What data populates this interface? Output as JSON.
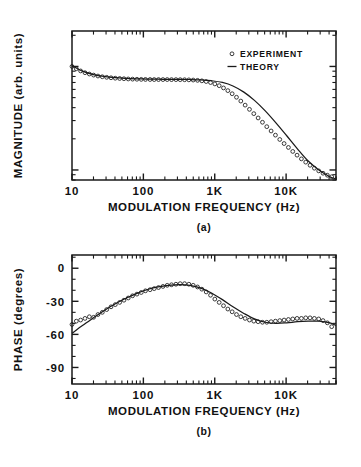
{
  "figure": {
    "caption_a": "(a)",
    "caption_b": "(b)"
  },
  "panel_a": {
    "ylabel": "MAGNITUDE (arb. units)",
    "xlabel": "MODULATION FREQUENCY (Hz)",
    "xticklabels": [
      "10",
      "100",
      "1K",
      "10K"
    ],
    "legend": [
      {
        "marker": "circle",
        "label": "EXPERIMENT"
      },
      {
        "marker": "line",
        "label": "THEORY"
      }
    ]
  },
  "panel_b": {
    "ylabel": "PHASE (degrees)",
    "xlabel": "MODULATION FREQUENCY (Hz)",
    "xticklabels": [
      "10",
      "100",
      "1K",
      "10K"
    ],
    "yticklabels": [
      "0",
      "-30",
      "-60",
      "-90"
    ]
  },
  "colors": {
    "ink": "#1a1a1a",
    "background": "#ffffff"
  },
  "chart_data": [
    {
      "type": "scatter",
      "panel": "a",
      "title": "",
      "xlabel": "MODULATION FREQUENCY (Hz)",
      "ylabel": "MAGNITUDE (arb. units)",
      "xscale": "log",
      "yscale": "log",
      "xlim": [
        10,
        50000
      ],
      "ylim": [
        0.08,
        2.2
      ],
      "grid": false,
      "legend_position": "upper-right",
      "xtick_values": [
        10,
        100,
        1000,
        10000
      ],
      "xtick_labels": [
        "10",
        "100",
        "1K",
        "10K"
      ],
      "ytick_labels": [],
      "series": [
        {
          "name": "EXPERIMENT",
          "marker": "open-circle",
          "x": [
            10,
            11.5,
            13.2,
            15.2,
            17.5,
            20.1,
            23.1,
            26.6,
            30.6,
            35.2,
            40.4,
            46.5,
            53.4,
            61.4,
            70.6,
            81.2,
            93.4,
            107,
            124,
            142,
            163,
            188,
            216,
            248,
            286,
            328,
            378,
            434,
            499,
            574,
            660,
            759,
            873,
            1003,
            1154,
            1327,
            1526,
            1754,
            2017,
            2319,
            2667,
            3066,
            3526,
            4054,
            4662,
            5360,
            6163,
            7087,
            8149,
            9369,
            10773,
            12386,
            14241,
            16375,
            18828,
            21650,
            24893,
            28622,
            32910,
            37840,
            43510
          ],
          "y": [
            1.0,
            0.95,
            0.905,
            0.87,
            0.845,
            0.825,
            0.808,
            0.795,
            0.785,
            0.777,
            0.77,
            0.765,
            0.761,
            0.757,
            0.754,
            0.752,
            0.75,
            0.749,
            0.748,
            0.747,
            0.747,
            0.747,
            0.747,
            0.746,
            0.746,
            0.745,
            0.744,
            0.742,
            0.739,
            0.734,
            0.726,
            0.715,
            0.699,
            0.678,
            0.652,
            0.62,
            0.584,
            0.545,
            0.504,
            0.463,
            0.423,
            0.385,
            0.35,
            0.318,
            0.289,
            0.262,
            0.238,
            0.217,
            0.197,
            0.18,
            0.165,
            0.151,
            0.139,
            0.128,
            0.119,
            0.111,
            0.104,
            0.098,
            0.093,
            0.089,
            0.086
          ]
        },
        {
          "name": "THEORY",
          "marker": "line",
          "x": [
            10,
            14,
            20,
            28,
            40,
            56,
            80,
            112,
            160,
            224,
            320,
            450,
            640,
            900,
            1280,
            1800,
            2560,
            3600,
            5100,
            7200,
            10200,
            14400,
            20400,
            28800,
            41000,
            50000
          ],
          "y": [
            1.02,
            0.9,
            0.835,
            0.8,
            0.778,
            0.767,
            0.76,
            0.756,
            0.753,
            0.751,
            0.75,
            0.748,
            0.742,
            0.728,
            0.7,
            0.648,
            0.565,
            0.47,
            0.372,
            0.285,
            0.214,
            0.16,
            0.122,
            0.1,
            0.086,
            0.082
          ]
        }
      ]
    },
    {
      "type": "scatter",
      "panel": "b",
      "title": "",
      "xlabel": "MODULATION FREQUENCY (Hz)",
      "ylabel": "PHASE (degrees)",
      "xscale": "log",
      "yscale": "linear",
      "xlim": [
        10,
        50000
      ],
      "ylim": [
        -105,
        12
      ],
      "grid": false,
      "legend_position": "none",
      "xtick_values": [
        10,
        100,
        1000,
        10000
      ],
      "xtick_labels": [
        "10",
        "100",
        "1K",
        "10K"
      ],
      "ytick_values": [
        0,
        -30,
        -60,
        -90
      ],
      "ytick_labels": [
        "0",
        "-30",
        "-60",
        "-90"
      ],
      "series": [
        {
          "name": "EXPERIMENT",
          "marker": "open-circle",
          "x": [
            10,
            11.5,
            13.2,
            15.2,
            17.5,
            20.1,
            23.1,
            26.6,
            30.6,
            35.2,
            40.4,
            46.5,
            53.4,
            61.4,
            70.6,
            81.2,
            93.4,
            107,
            124,
            142,
            163,
            188,
            216,
            248,
            286,
            328,
            378,
            434,
            499,
            574,
            660,
            759,
            873,
            1003,
            1154,
            1327,
            1526,
            1754,
            2017,
            2319,
            2667,
            3066,
            3526,
            4054,
            4662,
            5360,
            6163,
            7087,
            8149,
            9369,
            10773,
            12386,
            14241,
            16375,
            18828,
            21650,
            24893,
            28622,
            32910,
            37840,
            43510
          ],
          "y": [
            -51,
            -48,
            -47,
            -45.5,
            -44,
            -44.5,
            -42,
            -40,
            -37.5,
            -35,
            -33,
            -31,
            -29,
            -27,
            -25,
            -23.5,
            -22,
            -20.5,
            -19.5,
            -18.5,
            -17.5,
            -16.5,
            -15.5,
            -15,
            -14.5,
            -14,
            -14,
            -14.5,
            -15.5,
            -17,
            -19,
            -21.5,
            -24.5,
            -28,
            -31,
            -34,
            -37,
            -39.5,
            -42,
            -44,
            -45.5,
            -47,
            -48,
            -48.5,
            -49,
            -49,
            -48.5,
            -48,
            -47.5,
            -47,
            -46.5,
            -46,
            -45.5,
            -45.5,
            -45,
            -45,
            -45.5,
            -46,
            -47.5,
            -49.5,
            -53
          ]
        },
        {
          "name": "THEORY",
          "marker": "line",
          "x": [
            10,
            14,
            20,
            28,
            40,
            56,
            80,
            112,
            160,
            224,
            320,
            450,
            640,
            900,
            1280,
            1800,
            2560,
            3600,
            5100,
            7200,
            10200,
            14400,
            20400,
            28800,
            41000,
            50000
          ],
          "y": [
            -59,
            -52,
            -45,
            -38.5,
            -32.5,
            -27.5,
            -23,
            -19.5,
            -17,
            -15.5,
            -14.8,
            -15.5,
            -18,
            -22.5,
            -28.5,
            -35,
            -41,
            -46,
            -49,
            -50,
            -49.5,
            -48.5,
            -48,
            -48,
            -49.5,
            -52
          ]
        }
      ]
    }
  ]
}
